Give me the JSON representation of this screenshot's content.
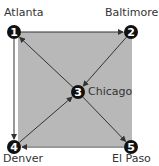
{
  "diagram": {
    "nodes": [
      {
        "id": "1",
        "label": "Atlanta",
        "x": 14,
        "y": 32
      },
      {
        "id": "2",
        "label": "Baltimore",
        "x": 131,
        "y": 32
      },
      {
        "id": "3",
        "label": "Chicago",
        "x": 78,
        "y": 92
      },
      {
        "id": "4",
        "label": "Denver",
        "x": 14,
        "y": 147
      },
      {
        "id": "5",
        "label": "El Paso",
        "x": 131,
        "y": 147
      }
    ],
    "edges": [
      {
        "from": "1",
        "to": "2"
      },
      {
        "from": "2",
        "to": "3"
      },
      {
        "from": "3",
        "to": "1"
      },
      {
        "from": "1",
        "to": "4"
      },
      {
        "from": "4",
        "to": "3"
      },
      {
        "from": "3",
        "to": "5"
      },
      {
        "from": "5",
        "to": "4"
      }
    ],
    "colors": {
      "fill": "#b8b8b8",
      "node": "#111111",
      "edge": "#333333"
    }
  }
}
